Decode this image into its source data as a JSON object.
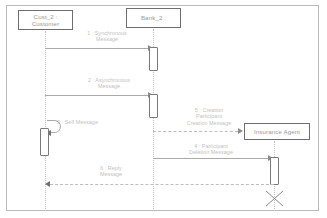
{
  "diagram": {
    "kind": "uml-sequence-diagram",
    "frame": {
      "border_color": "#b9b9b9",
      "background": "#ffffff"
    },
    "colors": {
      "box_border": "#6e6e6e",
      "lifeline": "#c3c3c3",
      "message_line": "#aaaaaa",
      "label_text": "#c2c2c2",
      "participant_text": "#9a9a9a",
      "activation_border": "#7a7a7a"
    }
  },
  "participants": [
    {
      "id": "customer",
      "name": "Cust_2 :",
      "type": "Customer"
    },
    {
      "id": "bank",
      "name": "Bank_2 :",
      "type": "Bank"
    },
    {
      "id": "insurance_agent",
      "name": "Insurance Agent",
      "type": ""
    }
  ],
  "messages": [
    {
      "id": "msg-1",
      "number": "1",
      "label_line1": "1 : Synchronous",
      "label_line2": "Message",
      "from": "customer",
      "to": "bank",
      "style": "solid",
      "kind": "synchronous"
    },
    {
      "id": "msg-2",
      "number": "2",
      "label_line1": "2 : Asynchronous",
      "label_line2": "Message",
      "from": "customer",
      "to": "bank",
      "style": "solid",
      "kind": "asynchronous"
    },
    {
      "id": "msg-3",
      "number": "3",
      "label_line1": "3 : Self Message",
      "label_line2": "",
      "from": "customer",
      "to": "customer",
      "style": "solid",
      "kind": "self"
    },
    {
      "id": "msg-5",
      "number": "5",
      "label_line1": "5 : Creation",
      "label_line2": "Participant",
      "label_line3": "Creation Message",
      "from": "bank",
      "to": "insurance_agent",
      "style": "dashed",
      "kind": "create"
    },
    {
      "id": "msg-4",
      "number": "4",
      "label_line1": "4 : Participant",
      "label_line2": "Deletion Message",
      "from": "bank",
      "to": "insurance_agent",
      "style": "solid",
      "kind": "delete"
    },
    {
      "id": "msg-6",
      "number": "6",
      "label_line1": "6 : Reply",
      "label_line2": "Message",
      "from": "insurance_agent",
      "to": "customer",
      "style": "dashed",
      "kind": "reply"
    }
  ],
  "markers": [
    {
      "id": "destruction",
      "name": "destruction-marker",
      "on": "insurance_agent"
    }
  ]
}
